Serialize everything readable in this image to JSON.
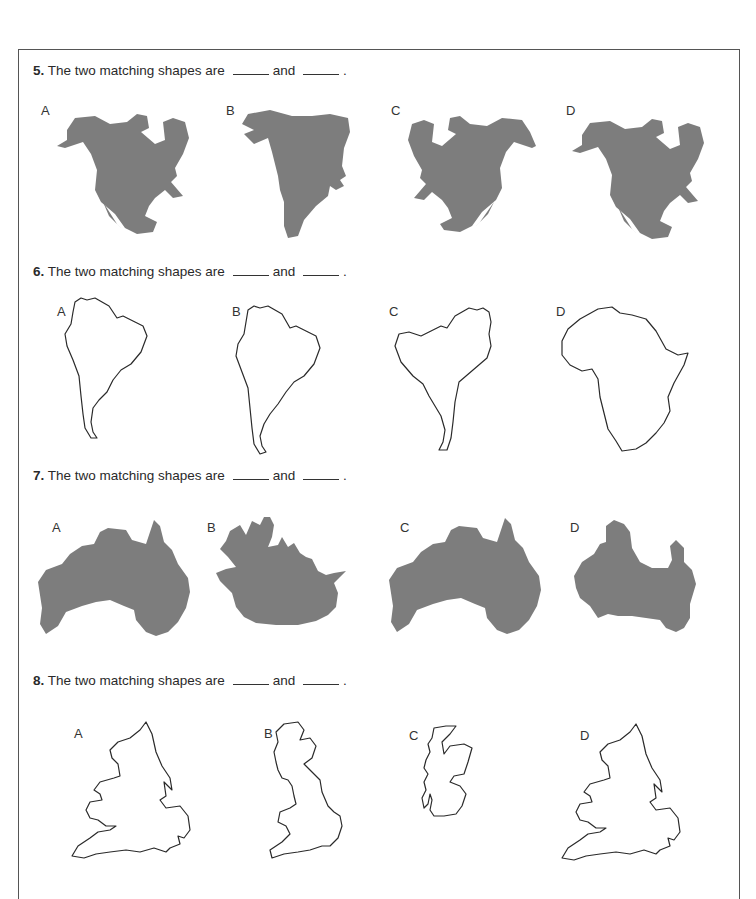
{
  "questions": [
    {
      "number": "5.",
      "text": "The two matching shapes are",
      "connector": "and",
      "end": ".",
      "style": "filled",
      "subject": "North America",
      "options": [
        {
          "label": "A",
          "description": "North America, normal orientation"
        },
        {
          "label": "B",
          "description": "North America, distorted/stretched"
        },
        {
          "label": "C",
          "description": "North America, mirrored horizontally"
        },
        {
          "label": "D",
          "description": "North America, normal orientation"
        }
      ]
    },
    {
      "number": "6.",
      "text": "The two matching shapes are",
      "connector": "and",
      "end": ".",
      "style": "outline",
      "subject": "South America",
      "options": [
        {
          "label": "A",
          "description": "South America outline"
        },
        {
          "label": "B",
          "description": "South America outline"
        },
        {
          "label": "C",
          "description": "South America outline, mirrored"
        },
        {
          "label": "D",
          "description": "Africa outline"
        }
      ]
    },
    {
      "number": "7.",
      "text": "The two matching shapes are",
      "connector": "and",
      "end": ".",
      "style": "filled",
      "subject": "Australia",
      "options": [
        {
          "label": "A",
          "description": "Australia, normal"
        },
        {
          "label": "B",
          "description": "Distorted landmass"
        },
        {
          "label": "C",
          "description": "Australia, normal"
        },
        {
          "label": "D",
          "description": "Australia, distorted"
        }
      ]
    },
    {
      "number": "8.",
      "text": "The two matching shapes are",
      "connector": "and",
      "end": ".",
      "style": "outline",
      "subject": "England and Wales",
      "options": [
        {
          "label": "A",
          "description": "England and Wales outline"
        },
        {
          "label": "B",
          "description": "Great Britain outline"
        },
        {
          "label": "C",
          "description": "Scotland outline"
        },
        {
          "label": "D",
          "description": "England and Wales outline"
        }
      ]
    }
  ],
  "colors": {
    "shape_fill": "#7d7d7d",
    "outline_stroke": "#2a2a2a",
    "frame_border": "#555555"
  }
}
